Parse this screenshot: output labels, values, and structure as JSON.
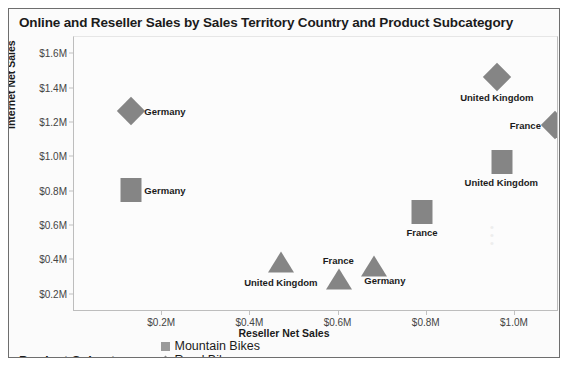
{
  "chart_data": {
    "type": "scatter",
    "title": "Online and Reseller Sales by Sales Territory Country and Product Subcategory",
    "xlabel": "Reseller Net Sales",
    "ylabel": "Internet Net Sales",
    "xlim": [
      0.0,
      1.1
    ],
    "ylim": [
      0.1,
      1.7
    ],
    "xticks": [
      "$0.2M",
      "$0.4M",
      "$0.6M",
      "$0.8M",
      "$1.0M"
    ],
    "xtick_values": [
      0.2,
      0.4,
      0.6,
      0.8,
      1.0
    ],
    "yticks": [
      "$0.2M",
      "$0.4M",
      "$0.6M",
      "$0.8M",
      "$1.0M",
      "$1.2M",
      "$1.4M",
      "$1.6M"
    ],
    "ytick_values": [
      0.2,
      0.4,
      0.6,
      0.8,
      1.0,
      1.2,
      1.4,
      1.6
    ],
    "grid": false,
    "legend_position": "bottom-left",
    "legend_title": "Product Subcategory",
    "series": [
      {
        "name": "Mountain Bikes",
        "marker": "square",
        "color": "#858585",
        "points": [
          {
            "label": "Germany",
            "x": 0.13,
            "y": 0.81,
            "label_pos": "right"
          },
          {
            "label": "United Kingdom",
            "x": 0.97,
            "y": 0.97,
            "label_pos": "below"
          },
          {
            "label": "France",
            "x": 0.79,
            "y": 0.68,
            "label_pos": "below"
          }
        ]
      },
      {
        "name": "Road Bikes",
        "marker": "diamond",
        "color": "#858585",
        "points": [
          {
            "label": "Germany",
            "x": 0.13,
            "y": 1.27,
            "label_pos": "right"
          },
          {
            "label": "United Kingdom",
            "x": 0.96,
            "y": 1.47,
            "label_pos": "below"
          },
          {
            "label": "France",
            "x": 1.09,
            "y": 1.19,
            "label_pos": "left"
          }
        ]
      },
      {
        "name": "Touring Bikes",
        "marker": "triangle",
        "color": "#858585",
        "points": [
          {
            "label": "United Kingdom",
            "x": 0.47,
            "y": 0.39,
            "label_pos": "below"
          },
          {
            "label": "France",
            "x": 0.6,
            "y": 0.29,
            "label_pos": "above"
          },
          {
            "label": "Germany",
            "x": 0.68,
            "y": 0.37,
            "label_pos": "below-right"
          }
        ]
      }
    ]
  },
  "legend": {
    "title": "Product Subcategory",
    "items": [
      {
        "label": "Mountain Bikes",
        "marker": "square"
      },
      {
        "label": "Road Bikes",
        "marker": "diamond"
      },
      {
        "label": "Touring Bikes",
        "marker": "triangle"
      }
    ]
  },
  "colors": {
    "marker": "#858585",
    "frame_border": "#6e6e6e",
    "plot_border": "#bdbdbd",
    "text": "#1b1b1b",
    "tick_text": "#444444",
    "plot_background": "#fcfcfc"
  }
}
